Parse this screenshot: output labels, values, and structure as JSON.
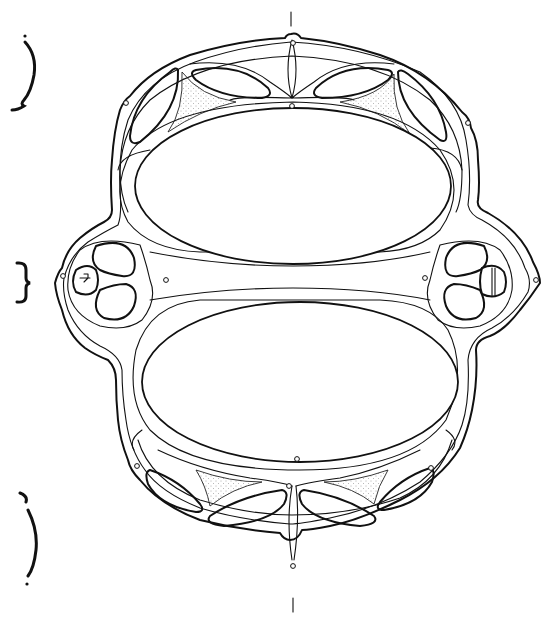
{
  "figure": {
    "stroke_color": "#111111",
    "background": "#ffffff",
    "stipple_color": "#555555"
  },
  "axis_marks": [
    {
      "name": "top-axis-tick",
      "x": 291,
      "y1": 12,
      "y2": 26
    },
    {
      "name": "bottom-axis-tick",
      "x": 293,
      "y1": 598,
      "y2": 612
    }
  ],
  "section_braces": [
    {
      "name": "upper-section-brace",
      "shape": "curly-open-right",
      "x": 18,
      "y1": 36,
      "y2": 108
    },
    {
      "name": "middle-section-brace",
      "shape": "curly-close",
      "x": 20,
      "y1": 262,
      "y2": 302
    },
    {
      "name": "lower-section-brace",
      "shape": "curly-open-right",
      "x": 22,
      "y1": 493,
      "y2": 585
    }
  ],
  "rivet_holes": [
    {
      "x": 293,
      "y": 43
    },
    {
      "x": 292,
      "y": 106
    },
    {
      "x": 126,
      "y": 103
    },
    {
      "x": 468,
      "y": 123
    },
    {
      "x": 63,
      "y": 276
    },
    {
      "x": 166,
      "y": 280
    },
    {
      "x": 425,
      "y": 278
    },
    {
      "x": 536,
      "y": 280
    },
    {
      "x": 137,
      "y": 466
    },
    {
      "x": 297,
      "y": 459
    },
    {
      "x": 431,
      "y": 468
    },
    {
      "x": 289,
      "y": 486
    },
    {
      "x": 293,
      "y": 566
    }
  ],
  "openings": {
    "upper_main": {
      "cx": 293,
      "cy": 186,
      "rx": 158,
      "ry": 78
    },
    "lower_main": {
      "cx": 300,
      "cy": 382,
      "rx": 158,
      "ry": 80
    }
  }
}
